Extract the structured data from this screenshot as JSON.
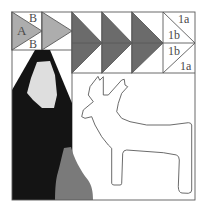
{
  "diagram": {
    "type": "quilt-block-pattern",
    "labels": {
      "goose_a": "A",
      "goose_b_top": "B",
      "goose_b_bottom": "B",
      "unit_1a_top": "1a",
      "unit_1b_upper": "1b",
      "unit_1b_lower": "1b",
      "unit_1a_bottom": "1a"
    },
    "sections": [
      "flying-geese-row-light",
      "flying-geese-row-dark",
      "paper-pieced-unit-1a-1b",
      "hooded-figure-panel",
      "reindeer-applique-panel"
    ]
  },
  "colors": {
    "background": "#ffffff",
    "light_gray": "#adadad",
    "dark_gray": "#6b6b6b",
    "black": "#141414",
    "face_light": "#dedede",
    "bottle_gray": "#7a7a7a",
    "line": "#5a5a5a"
  }
}
